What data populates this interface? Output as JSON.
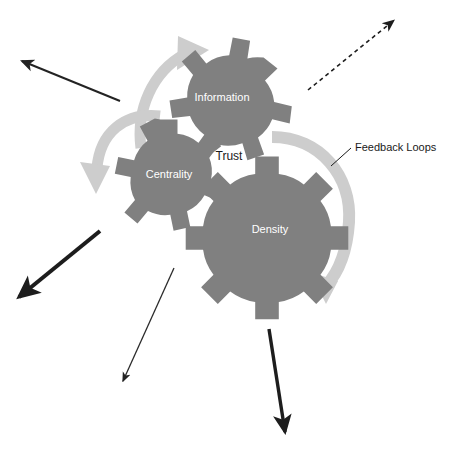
{
  "diagram": {
    "background_color": "#ffffff",
    "gear_color": "#808080",
    "gear_label_color": "#ffffff",
    "loop_arrow_color": "#c8c8c8",
    "text_color": "#1a1a1a",
    "gears": [
      {
        "id": "information",
        "label": "Information",
        "cx": 222,
        "cy": 94,
        "outer_radius": 55,
        "inner_radius": 41,
        "teeth": 7,
        "rotation": 12
      },
      {
        "id": "centrality",
        "label": "Centrality",
        "cx": 169,
        "cy": 171,
        "outer_radius": 52,
        "inner_radius": 38,
        "teeth": 7,
        "rotation": 0
      },
      {
        "id": "density",
        "label": "Density",
        "cx": 267,
        "cy": 226,
        "outer_radius": 70,
        "inner_radius": 53,
        "teeth": 8,
        "rotation": 6
      }
    ],
    "labels": [
      {
        "id": "trust",
        "text": "Trust",
        "x": 229,
        "y": 157
      },
      {
        "id": "feedback-loops",
        "text": "Feedback Loops",
        "x": 355,
        "y": 148
      }
    ],
    "callout_leader": {
      "from_x": 351,
      "from_y": 148,
      "to_x": 331,
      "to_y": 166
    },
    "feedback_loops": [
      {
        "id": "loop-information",
        "description": "curved arrow sweeping up over the Information gear"
      },
      {
        "id": "loop-centrality",
        "description": "curved arrow sweeping down around the Centrality gear"
      },
      {
        "id": "loop-density",
        "description": "large curved arrow arcing clockwise around the Density gear"
      }
    ],
    "outflow_arrows": [
      {
        "id": "arrow-up-left",
        "style": "solid-thin",
        "weight": 2,
        "x1": 120,
        "y1": 101,
        "x2": 19,
        "y2": 60
      },
      {
        "id": "arrow-up-right",
        "style": "dashed",
        "weight": 1.6,
        "x1": 308,
        "y1": 90,
        "x2": 396,
        "y2": 19
      },
      {
        "id": "arrow-down-left-thick",
        "style": "solid-thick",
        "weight": 4,
        "x1": 100,
        "y1": 231,
        "x2": 16,
        "y2": 300
      },
      {
        "id": "arrow-down-left-thin",
        "style": "solid-thin",
        "weight": 1.3,
        "x1": 174,
        "y1": 268,
        "x2": 121,
        "y2": 385
      },
      {
        "id": "arrow-down-center-thick",
        "style": "solid-thick",
        "weight": 3.4,
        "x1": 269,
        "y1": 329,
        "x2": 286,
        "y2": 437
      }
    ]
  }
}
